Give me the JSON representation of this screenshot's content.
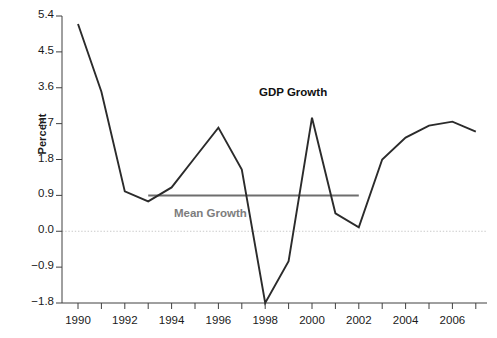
{
  "chart_data": {
    "type": "line",
    "title": "",
    "xlabel": "",
    "ylabel": "Percent",
    "xlim": [
      1989.5,
      2007.5
    ],
    "ylim": [
      -1.8,
      5.4
    ],
    "grid": false,
    "legend_position": "inline-annotations",
    "x": [
      1990,
      1991,
      1992,
      1993,
      1994,
      1995,
      1996,
      1997,
      1998,
      1999,
      2000,
      2001,
      2002,
      2003,
      2004,
      2005,
      2006,
      2007
    ],
    "y_ticks": [
      -1.8,
      -0.9,
      0.0,
      0.9,
      1.8,
      2.7,
      3.6,
      4.5,
      5.4
    ],
    "y_tick_labels": [
      "−1.8",
      "−0.9",
      "0.0",
      "0.9",
      "1.8",
      "2.7",
      "3.6",
      "4.5",
      "5.4"
    ],
    "x_ticks": [
      1990,
      1992,
      1994,
      1996,
      1998,
      2000,
      2002,
      2004,
      2006
    ],
    "x_tick_labels": [
      "1990",
      "1992",
      "1994",
      "1996",
      "1998",
      "2000",
      "2002",
      "2004",
      "2006"
    ],
    "x_minor_ticks": [
      1991,
      1993,
      1995,
      1997,
      1999,
      2001,
      2003,
      2005,
      2007
    ],
    "series": [
      {
        "name": "GDP Growth",
        "color": "#2b2b2b",
        "label_x": 2000,
        "label_y": 3.45,
        "values": [
          5.2,
          3.5,
          1.0,
          0.75,
          1.1,
          1.85,
          2.6,
          1.55,
          -1.8,
          -0.75,
          2.85,
          0.45,
          0.1,
          1.8,
          2.35,
          2.65,
          2.75,
          2.5
        ]
      }
    ],
    "reference_lines": [
      {
        "name": "Mean Growth",
        "color": "#6e6e6e",
        "value": 0.9,
        "x_start": 1993,
        "x_end": 2002,
        "label": "Mean Growth",
        "label_x": 1994.1,
        "label_y": 0.42
      },
      {
        "name": "zero-line",
        "color": "#c9c9c9",
        "value": 0.0,
        "style": "dotted",
        "label": ""
      }
    ]
  },
  "axes": {
    "y_axis_title": "Percent"
  }
}
